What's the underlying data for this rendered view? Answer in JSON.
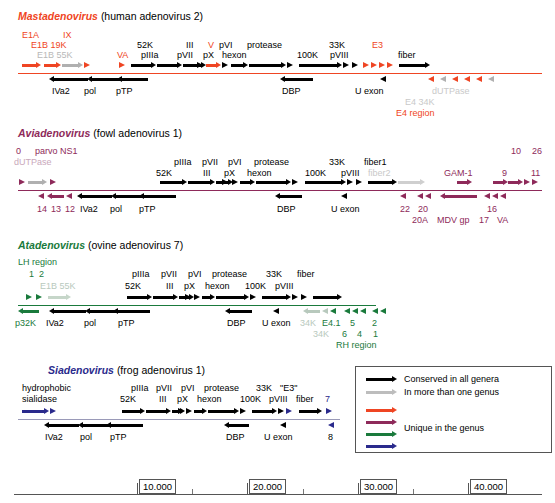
{
  "figure": {
    "scale_unit": "bp"
  },
  "colors": {
    "conserved_black": "#000000",
    "shared_gray": "#b0b0b0",
    "mast_red": "#ef4523",
    "avia_purple": "#8e2a5a",
    "ata_green": "#1a7a3c",
    "sia_navy": "#2a2a8c",
    "axis_gray": "#888888"
  },
  "genera": [
    {
      "id": "mastadenovirus",
      "name": "Mastadenovirus",
      "host": "(human adenovirus 2)",
      "accent": "#ef4523",
      "labels_above": [
        {
          "text": "E1A",
          "x": 22,
          "y": 30,
          "color": "#ef4523"
        },
        {
          "text": "IX",
          "x": 63,
          "y": 30,
          "color": "#ef4523"
        },
        {
          "text": "E1B 19K",
          "x": 31,
          "y": 40,
          "color": "#ef4523"
        },
        {
          "text": "E1B 55K",
          "x": 37,
          "y": 50,
          "color": "#b8b8b8"
        },
        {
          "text": "VA",
          "x": 117,
          "y": 50,
          "color": "#ef4523"
        },
        {
          "text": "52K",
          "x": 137,
          "y": 40,
          "color": "#000000"
        },
        {
          "text": "pIIIa",
          "x": 141,
          "y": 50,
          "color": "#000000"
        },
        {
          "text": "III",
          "x": 186,
          "y": 40,
          "color": "#000000"
        },
        {
          "text": "pVII",
          "x": 177,
          "y": 50,
          "color": "#000000"
        },
        {
          "text": "V",
          "x": 208,
          "y": 40,
          "color": "#ef4523"
        },
        {
          "text": "pX",
          "x": 203,
          "y": 50,
          "color": "#000000"
        },
        {
          "text": "pVI",
          "x": 219,
          "y": 40,
          "color": "#000000"
        },
        {
          "text": "hexon",
          "x": 222,
          "y": 50,
          "color": "#000000"
        },
        {
          "text": "protease",
          "x": 247,
          "y": 40,
          "color": "#000000"
        },
        {
          "text": "33K",
          "x": 329,
          "y": 40,
          "color": "#000000"
        },
        {
          "text": "100K",
          "x": 297,
          "y": 50,
          "color": "#000000"
        },
        {
          "text": "pVIII",
          "x": 330,
          "y": 50,
          "color": "#000000"
        },
        {
          "text": "E3",
          "x": 372,
          "y": 40,
          "color": "#ef4523"
        },
        {
          "text": "fiber",
          "x": 398,
          "y": 50,
          "color": "#000000"
        }
      ],
      "labels_below": [
        {
          "text": "IVa2",
          "x": 52,
          "y": 86,
          "color": "#000000"
        },
        {
          "text": "pol",
          "x": 84,
          "y": 86,
          "color": "#000000"
        },
        {
          "text": "pTP",
          "x": 116,
          "y": 86,
          "color": "#000000"
        },
        {
          "text": "DBP",
          "x": 282,
          "y": 86,
          "color": "#000000"
        },
        {
          "text": "U exon",
          "x": 355,
          "y": 86,
          "color": "#000000"
        },
        {
          "text": "dUTPase",
          "x": 432,
          "y": 86,
          "color": "#c9c9c9"
        },
        {
          "text": "E4 34K",
          "x": 405,
          "y": 97,
          "color": "#c9c9c9"
        },
        {
          "text": "E4 region",
          "x": 396,
          "y": 108,
          "color": "#ef4523"
        }
      ]
    },
    {
      "id": "aviadenovirus",
      "name": "Aviadenovirus",
      "host": "(fowl adenovirus 1)",
      "accent": "#8e2a5a",
      "labels_above": [
        {
          "text": "0",
          "x": 16,
          "y": 146,
          "color": "#8e2a5a"
        },
        {
          "text": "parvo NS1",
          "x": 35,
          "y": 146,
          "color": "#8e2a5a"
        },
        {
          "text": "dUTPase",
          "x": 14,
          "y": 157,
          "color": "#c9a8bb"
        },
        {
          "text": "52K",
          "x": 156,
          "y": 168,
          "color": "#000000"
        },
        {
          "text": "pIIIa",
          "x": 174,
          "y": 157,
          "color": "#000000"
        },
        {
          "text": "III",
          "x": 203,
          "y": 168,
          "color": "#000000"
        },
        {
          "text": "pVII",
          "x": 202,
          "y": 157,
          "color": "#000000"
        },
        {
          "text": "pX",
          "x": 224,
          "y": 168,
          "color": "#000000"
        },
        {
          "text": "pVI",
          "x": 228,
          "y": 157,
          "color": "#000000"
        },
        {
          "text": "hexon",
          "x": 247,
          "y": 168,
          "color": "#000000"
        },
        {
          "text": "protease",
          "x": 254,
          "y": 157,
          "color": "#000000"
        },
        {
          "text": "33K",
          "x": 329,
          "y": 157,
          "color": "#000000"
        },
        {
          "text": "100K",
          "x": 305,
          "y": 168,
          "color": "#000000"
        },
        {
          "text": "pVIII",
          "x": 341,
          "y": 168,
          "color": "#000000"
        },
        {
          "text": "fiber1",
          "x": 364,
          "y": 157,
          "color": "#000000"
        },
        {
          "text": "fiber2",
          "x": 368,
          "y": 168,
          "color": "#c9c9c9"
        },
        {
          "text": "GAM-1",
          "x": 444,
          "y": 168,
          "color": "#8e2a5a"
        },
        {
          "text": "10",
          "x": 511,
          "y": 146,
          "color": "#8e2a5a"
        },
        {
          "text": "26",
          "x": 532,
          "y": 146,
          "color": "#8e2a5a"
        },
        {
          "text": "9",
          "x": 502,
          "y": 168,
          "color": "#8e2a5a"
        },
        {
          "text": "11",
          "x": 531,
          "y": 168,
          "color": "#8e2a5a"
        }
      ],
      "labels_below": [
        {
          "text": "14",
          "x": 37,
          "y": 204,
          "color": "#8e2a5a"
        },
        {
          "text": "13",
          "x": 51,
          "y": 204,
          "color": "#8e2a5a"
        },
        {
          "text": "12",
          "x": 65,
          "y": 204,
          "color": "#8e2a5a"
        },
        {
          "text": "IVa2",
          "x": 80,
          "y": 204,
          "color": "#000000"
        },
        {
          "text": "pol",
          "x": 110,
          "y": 204,
          "color": "#000000"
        },
        {
          "text": "pTP",
          "x": 139,
          "y": 204,
          "color": "#000000"
        },
        {
          "text": "DBP",
          "x": 277,
          "y": 204,
          "color": "#000000"
        },
        {
          "text": "U exon",
          "x": 331,
          "y": 204,
          "color": "#000000"
        },
        {
          "text": "22",
          "x": 400,
          "y": 204,
          "color": "#8e2a5a"
        },
        {
          "text": "20",
          "x": 418,
          "y": 204,
          "color": "#8e2a5a"
        },
        {
          "text": "20A",
          "x": 412,
          "y": 215,
          "color": "#8e2a5a"
        },
        {
          "text": "MDV gp",
          "x": 437,
          "y": 215,
          "color": "#8e2a5a"
        },
        {
          "text": "16",
          "x": 487,
          "y": 204,
          "color": "#8e2a5a"
        },
        {
          "text": "17",
          "x": 479,
          "y": 215,
          "color": "#8e2a5a"
        },
        {
          "text": "VA",
          "x": 497,
          "y": 215,
          "color": "#8e2a5a"
        }
      ]
    },
    {
      "id": "atadenovirus",
      "name": "Atadenovirus",
      "host": "(ovine adenovirus 7)",
      "accent": "#1a7a3c",
      "labels_above": [
        {
          "text": "LH region",
          "x": 18,
          "y": 257,
          "color": "#1a7a3c"
        },
        {
          "text": "1",
          "x": 29,
          "y": 269,
          "color": "#1a7a3c"
        },
        {
          "text": "2",
          "x": 39,
          "y": 269,
          "color": "#1a7a3c"
        },
        {
          "text": "E1B 55K",
          "x": 40,
          "y": 281,
          "color": "#b8c9bd"
        },
        {
          "text": "52K",
          "x": 125,
          "y": 281,
          "color": "#000000"
        },
        {
          "text": "pIIIa",
          "x": 132,
          "y": 269,
          "color": "#000000"
        },
        {
          "text": "III",
          "x": 166,
          "y": 281,
          "color": "#000000"
        },
        {
          "text": "pVII",
          "x": 161,
          "y": 269,
          "color": "#000000"
        },
        {
          "text": "pX",
          "x": 184,
          "y": 281,
          "color": "#000000"
        },
        {
          "text": "pVI",
          "x": 188,
          "y": 269,
          "color": "#000000"
        },
        {
          "text": "hexon",
          "x": 205,
          "y": 281,
          "color": "#000000"
        },
        {
          "text": "protease",
          "x": 212,
          "y": 269,
          "color": "#000000"
        },
        {
          "text": "33K",
          "x": 266,
          "y": 269,
          "color": "#000000"
        },
        {
          "text": "100K",
          "x": 245,
          "y": 281,
          "color": "#000000"
        },
        {
          "text": "pVIII",
          "x": 275,
          "y": 281,
          "color": "#000000"
        },
        {
          "text": "fiber",
          "x": 297,
          "y": 269,
          "color": "#000000"
        }
      ],
      "labels_below": [
        {
          "text": "p32K",
          "x": 15,
          "y": 318,
          "color": "#1a7a3c"
        },
        {
          "text": "IVa2",
          "x": 46,
          "y": 318,
          "color": "#000000"
        },
        {
          "text": "pol",
          "x": 84,
          "y": 318,
          "color": "#000000"
        },
        {
          "text": "pTP",
          "x": 118,
          "y": 318,
          "color": "#000000"
        },
        {
          "text": "DBP",
          "x": 227,
          "y": 318,
          "color": "#000000"
        },
        {
          "text": "U exon",
          "x": 262,
          "y": 318,
          "color": "#000000"
        },
        {
          "text": "34K",
          "x": 300,
          "y": 318,
          "color": "#b8c9bd"
        },
        {
          "text": "E4.1",
          "x": 322,
          "y": 318,
          "color": "#1a7a3c"
        },
        {
          "text": "5",
          "x": 350,
          "y": 318,
          "color": "#1a7a3c"
        },
        {
          "text": "2",
          "x": 372,
          "y": 318,
          "color": "#1a7a3c"
        },
        {
          "text": "34K",
          "x": 313,
          "y": 329,
          "color": "#b8c9bd"
        },
        {
          "text": "6",
          "x": 342,
          "y": 329,
          "color": "#1a7a3c"
        },
        {
          "text": "4",
          "x": 357,
          "y": 329,
          "color": "#1a7a3c"
        },
        {
          "text": "1",
          "x": 373,
          "y": 329,
          "color": "#1a7a3c"
        },
        {
          "text": "RH region",
          "x": 336,
          "y": 340,
          "color": "#1a7a3c"
        }
      ]
    },
    {
      "id": "siadenovirus",
      "name": "Siadenovirus",
      "host": "(frog adenovirus 1)",
      "accent": "#2a2a8c",
      "labels_above": [
        {
          "text": "hydrophobic",
          "x": 22,
          "y": 383,
          "color": "#000000"
        },
        {
          "text": "sialidase",
          "x": 22,
          "y": 394,
          "color": "#000000"
        },
        {
          "text": "52K",
          "x": 120,
          "y": 394,
          "color": "#000000"
        },
        {
          "text": "pIIIa",
          "x": 131,
          "y": 383,
          "color": "#000000"
        },
        {
          "text": "III",
          "x": 159,
          "y": 394,
          "color": "#000000"
        },
        {
          "text": "pVII",
          "x": 156,
          "y": 383,
          "color": "#000000"
        },
        {
          "text": "pX",
          "x": 177,
          "y": 394,
          "color": "#000000"
        },
        {
          "text": "pVI",
          "x": 181,
          "y": 383,
          "color": "#000000"
        },
        {
          "text": "hexon",
          "x": 197,
          "y": 394,
          "color": "#000000"
        },
        {
          "text": "protease",
          "x": 204,
          "y": 383,
          "color": "#000000"
        },
        {
          "text": "33K",
          "x": 256,
          "y": 383,
          "color": "#000000"
        },
        {
          "text": "\"E3\"",
          "x": 280,
          "y": 383,
          "color": "#000000"
        },
        {
          "text": "100K",
          "x": 240,
          "y": 394,
          "color": "#000000"
        },
        {
          "text": "pVIII",
          "x": 269,
          "y": 394,
          "color": "#000000"
        },
        {
          "text": "fiber",
          "x": 296,
          "y": 394,
          "color": "#000000"
        },
        {
          "text": "7",
          "x": 325,
          "y": 394,
          "color": "#2a2a8c"
        }
      ],
      "labels_below": [
        {
          "text": "IVa2",
          "x": 45,
          "y": 432,
          "color": "#000000"
        },
        {
          "text": "pol",
          "x": 80,
          "y": 432,
          "color": "#000000"
        },
        {
          "text": "pTP",
          "x": 110,
          "y": 432,
          "color": "#000000"
        },
        {
          "text": "DBP",
          "x": 226,
          "y": 432,
          "color": "#000000"
        },
        {
          "text": "U exon",
          "x": 264,
          "y": 432,
          "color": "#000000"
        },
        {
          "text": "8",
          "x": 328,
          "y": 432,
          "color": "#000000"
        }
      ]
    }
  ],
  "legend": {
    "items": [
      {
        "label": "Conserved in all genera",
        "color": "#000000"
      },
      {
        "label": "In more than one genus",
        "color": "#b0b0b0"
      },
      {
        "label": "",
        "color": "#ef4523"
      },
      {
        "label": "",
        "color": "#8e2a5a"
      },
      {
        "label": "Unique in the genus",
        "color": "#1a7a3c"
      },
      {
        "label": "",
        "color": "#2a2a8c"
      }
    ]
  },
  "scale": {
    "ticks": [
      "10.000",
      "20.000",
      "30.000",
      "40.000"
    ],
    "tick_x": [
      137,
      247,
      358,
      468
    ]
  }
}
